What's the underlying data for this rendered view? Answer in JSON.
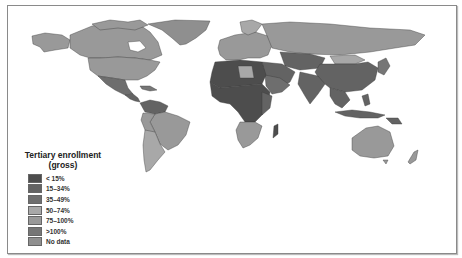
{
  "map": {
    "type": "choropleth",
    "subject": "Tertiary enrollment (gross) by country",
    "colors": {
      "lt15": "#4d4d4d",
      "15_34": "#636363",
      "35_49": "#6e6e6e",
      "50_74": "#a8a8a8",
      "75_100": "#999999",
      "gt100": "#767676",
      "nodata": "#8f8f8f",
      "ocean": "#ffffff",
      "border": "#3a3a3a"
    }
  },
  "legend": {
    "title_line1": "Tertiary enrollment",
    "title_line2": "(gross)",
    "items": [
      {
        "label": "< 15%",
        "color": "#4d4d4d"
      },
      {
        "label": "15–34%",
        "color": "#636363"
      },
      {
        "label": "35–49%",
        "color": "#6e6e6e"
      },
      {
        "label": "50–74%",
        "color": "#a8a8a8"
      },
      {
        "label": "75–100%",
        "color": "#999999"
      },
      {
        "label": ">100%",
        "color": "#767676"
      },
      {
        "label": "No data",
        "color": "#8f8f8f"
      }
    ]
  }
}
